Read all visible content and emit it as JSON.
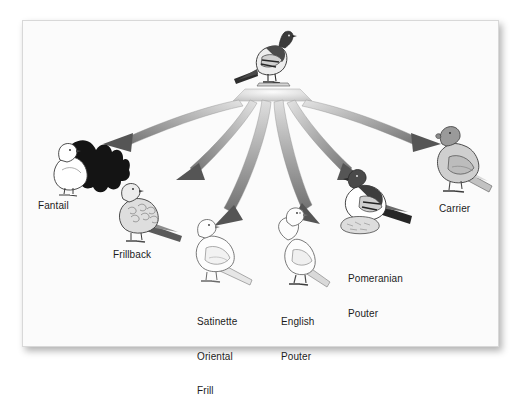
{
  "figure": {
    "kind": "evolutionary-radiation-diagram",
    "background_color": "#fbfbfb",
    "frame_border_color": "#d8d8d8",
    "label_color": "#1c1c1c",
    "arrow_fill_light": "#d6d6d6",
    "arrow_fill_dark": "#6d6d6d",
    "arrowhead_color": "#555555"
  },
  "ancestor": {
    "name": "rock-pigeon",
    "label": "",
    "description": "wild rock pigeon perched at top, dark head and back, pale grey breast, dark wing bars",
    "colors": {
      "head": "#3a3a3a",
      "body": "#e8e8e8",
      "wing_bar": "#2b2b2b"
    }
  },
  "arrows": [
    {
      "id": "arrow-to-fantail",
      "target": "Fantail",
      "direction": "far-left"
    },
    {
      "id": "arrow-to-frillback",
      "target": "Frillback",
      "direction": "left"
    },
    {
      "id": "arrow-to-satinette",
      "target": "Satinette Oriental Frill",
      "direction": "center-left"
    },
    {
      "id": "arrow-to-english-pouter",
      "target": "English Pouter",
      "direction": "center-right"
    },
    {
      "id": "arrow-to-pomeranian-pouter",
      "target": "Pomeranian Pouter",
      "direction": "right"
    },
    {
      "id": "arrow-to-carrier",
      "target": "Carrier",
      "direction": "far-right"
    }
  ],
  "breeds": [
    {
      "id": "fantail",
      "label": "Fantail",
      "label_lines": [
        "Fantail"
      ],
      "plumage": "white body with large black fanned tail",
      "colors": {
        "body": "#ffffff",
        "tail": "#151515",
        "outline": "#3a3a3a"
      }
    },
    {
      "id": "frillback",
      "label": "Frillback",
      "label_lines": [
        "Frillback"
      ],
      "plumage": "pale grey body with curled back feathers and dark tail",
      "colors": {
        "body": "#dcdcdc",
        "tail": "#4a4a4a",
        "outline": "#3a3a3a"
      }
    },
    {
      "id": "satinette-oriental-frill",
      "label": "Satinette Oriental Frill",
      "label_lines": [
        "Satinette",
        "Oriental",
        "Frill"
      ],
      "plumage": "white outline bird with faint grey wing shading",
      "colors": {
        "body": "#fdfdfd",
        "tail": "#e2e2e2",
        "outline": "#6a6a6a"
      }
    },
    {
      "id": "english-pouter",
      "label": "English Pouter",
      "label_lines": [
        "English",
        "Pouter"
      ],
      "plumage": "white upright bird with inflated crop and dark feet",
      "colors": {
        "body": "#fdfdfd",
        "tail": "#d4d4d4",
        "outline": "#6a6a6a"
      }
    },
    {
      "id": "pomeranian-pouter",
      "label": "Pomeranian Pouter",
      "label_lines": [
        "Pomeranian",
        "Pouter"
      ],
      "plumage": "dark head and back, white inflated breast, dark barred tail, feathered feet",
      "colors": {
        "body": "#ffffff",
        "head": "#3a3a3a",
        "tail": "#262626",
        "outline": "#333333"
      }
    },
    {
      "id": "carrier",
      "label": "Carrier",
      "label_lines": [
        "Carrier"
      ],
      "plumage": "grey body with wattled head and long tail",
      "colors": {
        "body": "#cfcfcf",
        "head": "#8f8f8f",
        "tail": "#bdbdbd",
        "outline": "#3a3a3a"
      }
    }
  ]
}
